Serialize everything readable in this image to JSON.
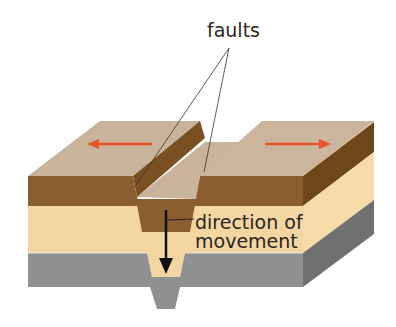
{
  "diagram": {
    "type": "geological-cross-section",
    "labels": {
      "faults": "faults",
      "direction_line1": "direction of",
      "direction_line2": "movement"
    },
    "arrows": {
      "left_plate": "moves left",
      "right_plate": "moves right",
      "central_block": "moves down"
    },
    "colors": {
      "top_surface": "#c9b39a",
      "brown_layer": "#8a5e2e",
      "brown_side": "#6e4619",
      "tan_layer": "#f3d6a2",
      "tan_side": "#f7dca9",
      "gray_layer": "#8f9090",
      "gray_side": "#6f7070",
      "plate_arrow": "#e8542a",
      "movement_arrow": "#111111"
    }
  }
}
